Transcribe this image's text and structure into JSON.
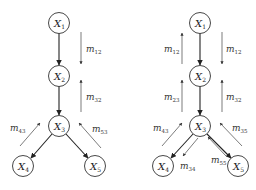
{
  "diagram": {
    "panels": [
      {
        "id": "left",
        "nodes": [
          {
            "id": "X1",
            "label": "X",
            "sub": "1",
            "cx": 59,
            "cy": 23
          },
          {
            "id": "X2",
            "label": "X",
            "sub": "2",
            "cx": 59,
            "cy": 76
          },
          {
            "id": "X3",
            "label": "X",
            "sub": "3",
            "cx": 59,
            "cy": 126
          },
          {
            "id": "X4",
            "label": "X",
            "sub": "4",
            "cx": 23,
            "cy": 166
          },
          {
            "id": "X5",
            "label": "X",
            "sub": "5",
            "cx": 95,
            "cy": 166
          }
        ],
        "edges": [
          [
            "X1",
            "X2"
          ],
          [
            "X2",
            "X3"
          ],
          [
            "X3",
            "X4"
          ],
          [
            "X3",
            "X5"
          ]
        ],
        "messages": [
          {
            "label": "m",
            "sub": "12",
            "direction": "down",
            "from": "X1",
            "to": "X2"
          },
          {
            "label": "m",
            "sub": "32",
            "direction": "up",
            "from": "X3",
            "to": "X2"
          },
          {
            "label": "m",
            "sub": "43",
            "direction": "up",
            "from": "X4",
            "to": "X3"
          },
          {
            "label": "m",
            "sub": "53",
            "direction": "up",
            "from": "X5",
            "to": "X3"
          }
        ]
      },
      {
        "id": "right",
        "nodes": [
          {
            "id": "X1",
            "label": "X",
            "sub": "1",
            "cx": 200,
            "cy": 23
          },
          {
            "id": "X2",
            "label": "X",
            "sub": "2",
            "cx": 200,
            "cy": 76
          },
          {
            "id": "X3",
            "label": "X",
            "sub": "3",
            "cx": 200,
            "cy": 126
          },
          {
            "id": "X4",
            "label": "X",
            "sub": "4",
            "cx": 163,
            "cy": 166
          },
          {
            "id": "X5",
            "label": "X",
            "sub": "5",
            "cx": 238,
            "cy": 166
          }
        ],
        "edges": [
          [
            "X1",
            "X2"
          ],
          [
            "X2",
            "X3"
          ],
          [
            "X3",
            "X4"
          ],
          [
            "X3",
            "X5"
          ]
        ],
        "messages": [
          {
            "label": "m",
            "sub": "12",
            "direction": "up"
          },
          {
            "label": "m",
            "sub": "12",
            "direction": "down"
          },
          {
            "label": "m",
            "sub": "23",
            "direction": "up"
          },
          {
            "label": "m",
            "sub": "32",
            "direction": "up"
          },
          {
            "label": "m",
            "sub": "43",
            "direction": "up"
          },
          {
            "label": "m",
            "sub": "34",
            "direction": "down"
          },
          {
            "label": "m",
            "sub": "55",
            "direction": "up"
          },
          {
            "label": "m",
            "sub": "35",
            "direction": "down"
          }
        ]
      }
    ]
  }
}
